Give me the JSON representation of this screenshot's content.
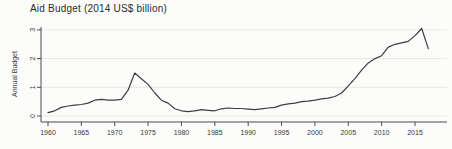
{
  "figure": {
    "title": "Aid Budget (2014 US$ billion)"
  },
  "chart_data": {
    "type": "line",
    "title": "Aid Budget (2014 US$ billion)",
    "xlabel": "",
    "ylabel": "Annual Budget",
    "legend": "none",
    "grid": "horizontal",
    "xlim": [
      1959,
      2019
    ],
    "ylim": [
      0,
      3.2
    ],
    "xticks": [
      1960,
      1965,
      1970,
      1975,
      1980,
      1985,
      1990,
      1995,
      2000,
      2005,
      2010,
      2015
    ],
    "yticks": [
      0,
      1,
      2,
      3
    ],
    "x": [
      1960,
      1961,
      1962,
      1963,
      1964,
      1965,
      1966,
      1967,
      1968,
      1969,
      1970,
      1971,
      1972,
      1973,
      1974,
      1975,
      1976,
      1977,
      1978,
      1979,
      1980,
      1981,
      1982,
      1983,
      1984,
      1985,
      1986,
      1987,
      1988,
      1989,
      1990,
      1991,
      1992,
      1993,
      1994,
      1995,
      1996,
      1997,
      1998,
      1999,
      2000,
      2001,
      2002,
      2003,
      2004,
      2005,
      2006,
      2007,
      2008,
      2009,
      2010,
      2011,
      2012,
      2013,
      2014,
      2015,
      2016,
      2017
    ],
    "series": [
      {
        "name": "Annual Budget",
        "values": [
          0.12,
          0.18,
          0.3,
          0.35,
          0.38,
          0.4,
          0.45,
          0.55,
          0.58,
          0.55,
          0.55,
          0.58,
          0.9,
          1.5,
          1.3,
          1.1,
          0.8,
          0.55,
          0.45,
          0.25,
          0.18,
          0.15,
          0.18,
          0.22,
          0.2,
          0.18,
          0.25,
          0.28,
          0.26,
          0.26,
          0.24,
          0.22,
          0.25,
          0.28,
          0.3,
          0.38,
          0.42,
          0.45,
          0.5,
          0.52,
          0.55,
          0.6,
          0.62,
          0.68,
          0.8,
          1.05,
          1.3,
          1.6,
          1.85,
          2.0,
          2.1,
          2.4,
          2.5,
          2.55,
          2.6,
          2.8,
          3.05,
          2.35
        ]
      }
    ],
    "colors": {
      "line": "#3d3d3d",
      "grid": "#e7e7e5",
      "axis": "#4a4a4a",
      "tick_text": "#3a3a3a",
      "background": "#fcfcfb"
    }
  }
}
